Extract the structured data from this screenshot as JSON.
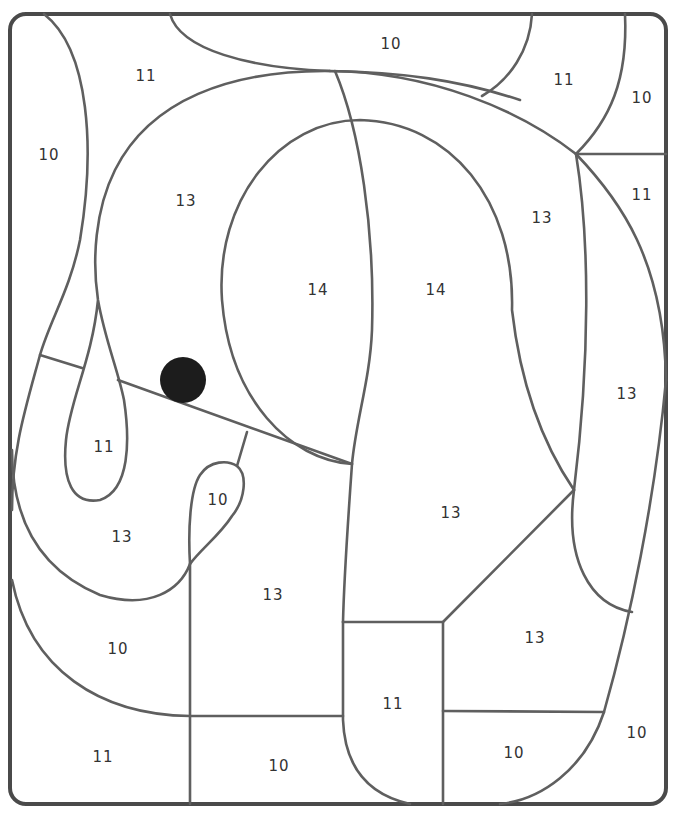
{
  "page": {
    "type": "color-by-number",
    "line_color": "#5f5f5f",
    "frame_color": "#4a4a4a"
  },
  "regions": [
    {
      "id": "top-left-11",
      "number": "11",
      "x": 146,
      "y": 76
    },
    {
      "id": "top-10",
      "number": "10",
      "x": 391,
      "y": 44
    },
    {
      "id": "top-right-11",
      "number": "11",
      "x": 564,
      "y": 80
    },
    {
      "id": "corner-10",
      "number": "10",
      "x": 642,
      "y": 98
    },
    {
      "id": "left-10",
      "number": "10",
      "x": 49,
      "y": 155
    },
    {
      "id": "right-11",
      "number": "11",
      "x": 642,
      "y": 195
    },
    {
      "id": "head-13",
      "number": "13",
      "x": 186,
      "y": 201
    },
    {
      "id": "head-right-13",
      "number": "13",
      "x": 542,
      "y": 218
    },
    {
      "id": "ear-left-14",
      "number": "14",
      "x": 318,
      "y": 290
    },
    {
      "id": "ear-right-14",
      "number": "14",
      "x": 436,
      "y": 290
    },
    {
      "id": "trunk-13",
      "number": "13",
      "x": 627,
      "y": 394
    },
    {
      "id": "tusk-11",
      "number": "11",
      "x": 104,
      "y": 447
    },
    {
      "id": "mouth-10",
      "number": "10",
      "x": 218,
      "y": 500
    },
    {
      "id": "body-13",
      "number": "13",
      "x": 451,
      "y": 513
    },
    {
      "id": "trunk-curl-13",
      "number": "13",
      "x": 122,
      "y": 537
    },
    {
      "id": "leg-13",
      "number": "13",
      "x": 273,
      "y": 595
    },
    {
      "id": "belly-13",
      "number": "13",
      "x": 535,
      "y": 638
    },
    {
      "id": "ground-left-10",
      "number": "10",
      "x": 118,
      "y": 649
    },
    {
      "id": "foot-11",
      "number": "11",
      "x": 393,
      "y": 704
    },
    {
      "id": "bottom-right-10",
      "number": "10",
      "x": 637,
      "y": 733
    },
    {
      "id": "bottom-foot-10",
      "number": "10",
      "x": 514,
      "y": 753
    },
    {
      "id": "bottom-left-11",
      "number": "11",
      "x": 103,
      "y": 757
    },
    {
      "id": "bottom-mid-10",
      "number": "10",
      "x": 279,
      "y": 766
    }
  ]
}
